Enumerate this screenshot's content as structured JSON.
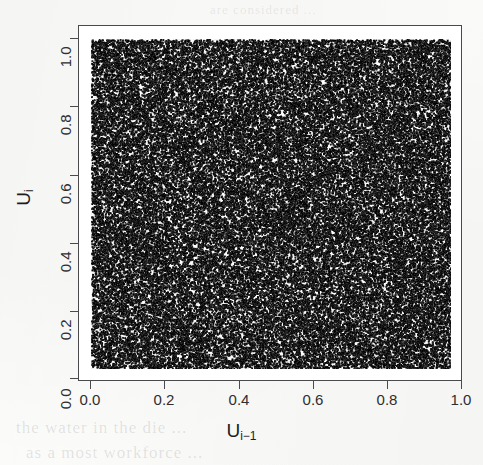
{
  "figure": {
    "name": "lag-scatter-plot",
    "medium": "scanned-page",
    "background_color": "#fdfdfc",
    "ink_color": "#1d1d1f",
    "frame_color": "#4a4a4c"
  },
  "ghost_bleed": {
    "line_1": "the water in the die ... ",
    "line_2": "as a most workforce ... ",
    "line_3": "are considered ...",
    "line_4": "in the ..."
  },
  "axes": {
    "x_title_base": "U",
    "x_title_sub": "i−1",
    "y_title_base": "U",
    "y_title_sub": "i",
    "x_tick_labels": [
      "0.0",
      "0.2",
      "0.4",
      "0.6",
      "0.8",
      "1.0"
    ],
    "y_tick_labels": [
      "1.0",
      "0.8",
      "0.6",
      "0.4",
      "0.2",
      "0.0"
    ]
  },
  "chart_data": {
    "type": "scatter",
    "title": "",
    "subtitle": "",
    "xlabel": "U(i-1)",
    "ylabel": "U(i)",
    "xlim": [
      0.0,
      1.0
    ],
    "ylim": [
      0.0,
      1.0
    ],
    "xticks": [
      0.0,
      0.2,
      0.4,
      0.6,
      0.8,
      1.0
    ],
    "yticks": [
      0.0,
      0.2,
      0.4,
      0.6,
      0.8,
      1.0
    ],
    "grid": false,
    "legend": null,
    "annotations": [],
    "series": [
      {
        "name": "uniform lag pairs",
        "marker": "point",
        "color": "#141414",
        "point_size": 1,
        "n_points": 60000,
        "distribution": "uniform-iid-overplotted",
        "description": "Dense overplotted scatter of consecutive pseudo-random uniform deviates U(i) versus U(i-1); fills the unit square with no visible lattice structure."
      }
    ]
  }
}
